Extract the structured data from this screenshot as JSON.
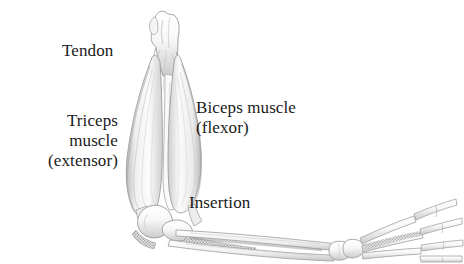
{
  "figure": {
    "background_color": "#ffffff",
    "ink_color": "#1a1a1a",
    "line_color": "#8a8a8a",
    "shade_light": "#f2f2f2",
    "shade_mid": "#d8d8d8",
    "shade_dark": "#9a9a9a",
    "stipple_color": "#7d7d7d"
  },
  "labels": {
    "tendon": "Tendon",
    "triceps_line1": "Triceps",
    "triceps_line2": "muscle",
    "triceps_line3": "(extensor)",
    "biceps_line1": "Biceps muscle",
    "biceps_line2": "(flexor)",
    "insertion": "Insertion"
  },
  "structures": [
    {
      "name": "humerus",
      "label": "Humerus bone (upper arm), running vertically"
    },
    {
      "name": "triceps-muscle",
      "label": "Triceps muscle belly on the left (posterior) side"
    },
    {
      "name": "biceps-muscle",
      "label": "Biceps muscle belly on the right (anterior) side"
    },
    {
      "name": "tendon",
      "label": "Tendons at the upper attachment near the shoulder"
    },
    {
      "name": "elbow-joint",
      "label": "Elbow joint with olecranon"
    },
    {
      "name": "insertion-point",
      "label": "Dark stippled tendon insertion at the elbow"
    },
    {
      "name": "radius",
      "label": "Radius bone of the forearm"
    },
    {
      "name": "ulna",
      "label": "Ulna bone of the forearm"
    },
    {
      "name": "carpals",
      "label": "Wrist carpal bones"
    },
    {
      "name": "metacarpals",
      "label": "Hand metacarpal bones"
    },
    {
      "name": "phalanges",
      "label": "Finger bones fanning outward"
    }
  ]
}
